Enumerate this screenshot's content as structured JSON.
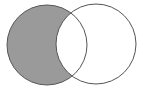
{
  "diagram": {
    "type": "venn",
    "colors": {
      "background": "#ffffff",
      "shaded_fill": "#9a9a9a",
      "stroke": "#555555"
    },
    "circles": [
      {
        "name": "A",
        "cx": 47,
        "cy": 45,
        "r": 40,
        "shaded": true
      },
      {
        "name": "B",
        "cx": 96,
        "cy": 44,
        "r": 40,
        "shaded": false
      }
    ],
    "shaded_region": "A-B"
  }
}
